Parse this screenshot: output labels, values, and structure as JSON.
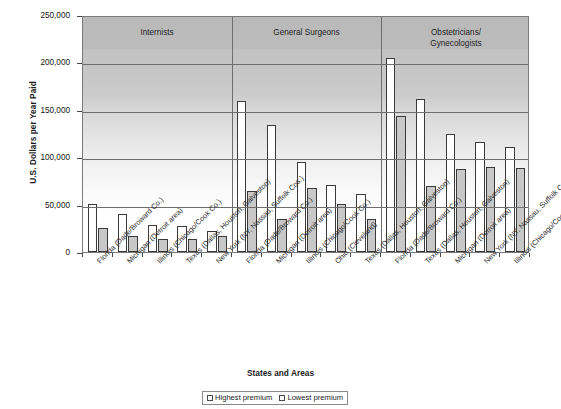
{
  "chart_data": {
    "type": "bar",
    "title": "",
    "xlabel": "States and Areas",
    "ylabel": "U.S. Dollars per Year Paid",
    "ylim": [
      0,
      250000
    ],
    "ytick_labels": [
      "250,000",
      "200,000",
      "150,000",
      "100,000",
      "50,000",
      "0"
    ],
    "ytick_values": [
      250000,
      200000,
      150000,
      100000,
      50000,
      0
    ],
    "grid": true,
    "legend_position": "bottom-center",
    "groups": [
      {
        "name": "Internists",
        "categories": [
          "Florida (Dade/Broward Co.)",
          "Michigan (Detroit area)",
          "Illinois (Chicago/Cook Co.)",
          "Texas (Dallas, Houston, Galveston)",
          "New York (NY, Nassau, Suffolk Cos.)"
        ],
        "highest_premium": [
          51000,
          40000,
          29000,
          27000,
          22000
        ],
        "lowest_premium": [
          25000,
          17000,
          14000,
          14000,
          17000
        ]
      },
      {
        "name": "General Surgeons",
        "categories": [
          "Florida (Dade/Broward Co.)",
          "Michigan (Detroit area)",
          "Illinois (Chicago/Cook Co.)",
          "Ohio (Cleveland)",
          "Texas (Dallas, Houston, Galveston)"
        ],
        "highest_premium": [
          159000,
          134000,
          95000,
          71000,
          61000
        ],
        "lowest_premium": [
          64000,
          35000,
          67000,
          51000,
          35000
        ]
      },
      {
        "name": "Obstetricians/\nGynecologists",
        "categories": [
          "Florida (Dade/Broward Co.)",
          "Texas (Dallas, Houston, Galveston)",
          "Michigan (Detroit area)",
          "New York (NY, Nassau, Suffolk Cos.)",
          "Illinois (Chicago/Cook Co.)"
        ],
        "highest_premium": [
          205000,
          161000,
          124000,
          116000,
          111000
        ],
        "lowest_premium": [
          144000,
          70000,
          88000,
          90000,
          89000
        ]
      }
    ],
    "series": [
      {
        "name": "Highest premium",
        "color": "#ffffff"
      },
      {
        "name": "Lowest premium",
        "color": "#c8c8c8"
      }
    ],
    "legend": [
      "Highest premium",
      "Lowest premium"
    ]
  },
  "legend": {
    "highest_label": "Highest premium",
    "lowest_label": "Lowest premium"
  },
  "axes": {
    "y_title": "U.S. Dollars per Year Paid",
    "x_title": "States and Areas"
  },
  "group_labels": {
    "internists": "Internists",
    "general_surgeons": "General Surgeons",
    "obgyn_line1": "Obstetricians/",
    "obgyn_line2": "Gynecologists"
  }
}
